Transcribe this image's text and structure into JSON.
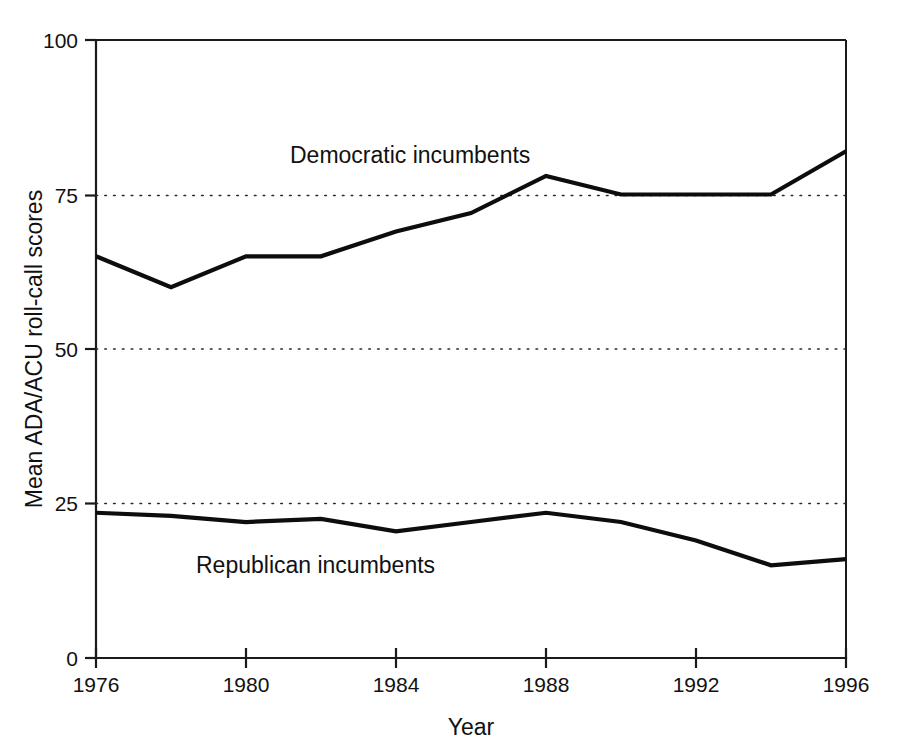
{
  "chart_data": {
    "type": "line",
    "title": "",
    "xlabel": "Year",
    "ylabel": "Mean ADA/ACU roll-call scores",
    "xlim": [
      1976,
      1996
    ],
    "ylim": [
      0,
      100
    ],
    "grid": "horizontal dotted gridlines at 25, 50 and 75",
    "legend_position": "inline labels on plot (no legend box)",
    "x": [
      1976,
      1978,
      1980,
      1982,
      1984,
      1986,
      1988,
      1990,
      1992,
      1994,
      1996
    ],
    "xticks": [
      "1976",
      "1980",
      "1984",
      "1988",
      "1992",
      "1996"
    ],
    "xtick_values": [
      1976,
      1980,
      1984,
      1988,
      1992,
      1996
    ],
    "yticks": [
      "0",
      "25",
      "50",
      "75",
      "100"
    ],
    "ytick_values": [
      0,
      25,
      50,
      75,
      100
    ],
    "series": [
      {
        "name": "Democratic incumbents",
        "values": [
          65,
          60,
          65,
          65,
          69,
          72,
          78,
          75,
          75,
          75,
          82
        ]
      },
      {
        "name": "Republican incumbents",
        "values": [
          23.5,
          23,
          22,
          22.5,
          20.5,
          22,
          23.5,
          22,
          19,
          15,
          16
        ]
      }
    ],
    "annotations": [
      {
        "text": "Democratic incumbents",
        "x": 1987,
        "y": 88
      },
      {
        "text": "Republican incumbents",
        "x": 1981.5,
        "y": 12.5
      }
    ]
  },
  "axes": {
    "y_axis_title": "Mean ADA/ACU roll-call scores",
    "x_axis_title": "Year",
    "y_tick_labels": [
      "100",
      "75",
      "50",
      "25",
      "0"
    ],
    "x_tick_labels": [
      "1976",
      "1980",
      "1984",
      "1988",
      "1992",
      "1996"
    ]
  },
  "labels": {
    "democratic": "Democratic incumbents",
    "republican": "Republican incumbents"
  },
  "colors": {
    "line": "#0d0d0d",
    "axis": "#1a1a1a",
    "grid": "#2b2b2b",
    "background": "#ffffff",
    "text": "#111111"
  }
}
